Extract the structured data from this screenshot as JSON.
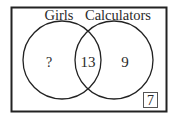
{
  "diagram": {
    "type": "venn",
    "sets": [
      {
        "label": "Girls",
        "only_value": "?"
      },
      {
        "label": "Calculators",
        "only_value": "9"
      }
    ],
    "intersection_value": "13",
    "outside_value": "7",
    "colors": {
      "stroke": "#222222",
      "text": "#2a2a2a",
      "background": "#ffffff"
    }
  }
}
